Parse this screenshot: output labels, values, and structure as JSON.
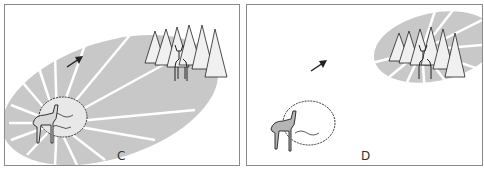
{
  "panels": [
    {
      "id": "C",
      "label": "C",
      "description": "Large gray cone of light/scent radiating from deer at bush (lower-left) extending toward deer in trees (upper-right); arrow pointing up-right"
    },
    {
      "id": "D",
      "label": "D",
      "description": "Gray radiating cone only around deer in trees (upper-right); deer at bush (lower-left) has no cone; arrow pointing up-right"
    }
  ],
  "colors": {
    "cone": "#c8c8c8",
    "rays": "#ffffff",
    "ink": "#222222",
    "border": "#8a8a8a",
    "deer_fill": "#b5b5b5"
  }
}
